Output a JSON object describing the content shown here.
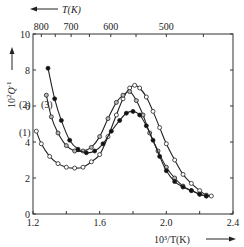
{
  "chart_data": {
    "type": "line",
    "title": "",
    "xlabel": "10^3/T(K)",
    "ylabel": "10^2 Q^-1",
    "top_axis_label": "T(K)",
    "xlim": [
      1.2,
      2.4
    ],
    "ylim": [
      0,
      10
    ],
    "x_ticks": [
      1.2,
      1.6,
      2.0,
      2.4
    ],
    "x_tick_labels": [
      "1.2",
      "1.6",
      "2.0",
      "2.4"
    ],
    "y_ticks": [
      0,
      2,
      4,
      6,
      8,
      10
    ],
    "y_tick_labels": [
      "0",
      "2",
      "4",
      "6",
      "8",
      "10"
    ],
    "top_ticks": [
      800,
      700,
      600,
      500
    ],
    "top_tick_labels": [
      "800",
      "700",
      "600",
      "500"
    ],
    "grid": false,
    "legend": "inline labels (1), (2), (3) near curve starts",
    "series": [
      {
        "name": "(1)",
        "marker": "open-circle",
        "x": [
          1.22,
          1.25,
          1.3,
          1.35,
          1.4,
          1.45,
          1.5,
          1.55,
          1.6,
          1.65,
          1.7,
          1.74,
          1.78,
          1.81,
          1.84,
          1.88,
          1.92,
          1.96,
          2.0,
          2.05,
          2.1,
          2.15,
          2.2,
          2.24,
          2.27
        ],
        "y": [
          4.6,
          3.9,
          3.2,
          2.8,
          2.6,
          2.55,
          2.6,
          2.9,
          3.3,
          4.3,
          5.5,
          6.4,
          7.0,
          7.15,
          7.0,
          6.5,
          5.7,
          4.8,
          3.9,
          3.0,
          2.2,
          1.7,
          1.3,
          1.05,
          1.0
        ]
      },
      {
        "name": "(2)",
        "marker": "grey-circle",
        "x": [
          1.28,
          1.31,
          1.35,
          1.4,
          1.45,
          1.5,
          1.55,
          1.6,
          1.65,
          1.7,
          1.74,
          1.78,
          1.82,
          1.86,
          1.9,
          1.95,
          2.0,
          2.05,
          2.1,
          2.15,
          2.2,
          2.24
        ],
        "y": [
          6.6,
          5.4,
          4.5,
          3.8,
          3.5,
          3.5,
          3.7,
          4.3,
          5.3,
          6.2,
          6.6,
          6.8,
          6.3,
          5.5,
          4.5,
          3.5,
          2.6,
          2.0,
          1.55,
          1.3,
          1.1,
          1.0
        ]
      },
      {
        "name": "(3)",
        "marker": "filled-circle",
        "x": [
          1.29,
          1.33,
          1.37,
          1.42,
          1.47,
          1.52,
          1.57,
          1.62,
          1.67,
          1.72,
          1.76,
          1.8,
          1.84,
          1.88,
          1.92,
          1.96,
          2.0,
          2.05,
          2.1,
          2.15,
          2.2,
          2.24
        ],
        "y": [
          8.1,
          6.4,
          5.2,
          4.1,
          3.6,
          3.4,
          3.5,
          3.9,
          4.6,
          5.2,
          5.6,
          5.7,
          5.5,
          4.9,
          4.1,
          3.2,
          2.4,
          1.8,
          1.5,
          1.3,
          1.1,
          1.0
        ]
      }
    ]
  },
  "labels": {
    "top_axis": "T(K)",
    "x_axis": "10³/T(K)",
    "y_axis_base": "10",
    "y_axis_exp": "2",
    "y_axis_var": "Q",
    "y_axis_var_exp": "-1"
  }
}
